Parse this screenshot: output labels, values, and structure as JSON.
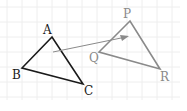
{
  "diagram": {
    "triangle_abc": {
      "labels": {
        "A": "A",
        "B": "B",
        "C": "C"
      },
      "color": "#1a1a1a"
    },
    "triangle_pqr": {
      "labels": {
        "P": "P",
        "Q": "Q",
        "R": "R"
      },
      "color": "#8a8a8a"
    },
    "arrow": {
      "color": "#8a8a8a",
      "meaning": "translation"
    },
    "grid_color": "#ececec"
  }
}
